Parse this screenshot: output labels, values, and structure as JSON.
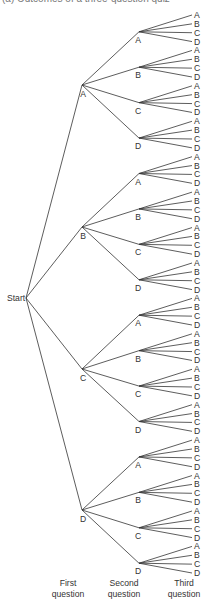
{
  "caption": "(a) Outcomes of a three-question quiz",
  "root": {
    "label": "Start",
    "x": 26,
    "y": 298,
    "label_x": 7
  },
  "options": [
    "A",
    "B",
    "C",
    "D"
  ],
  "levels": {
    "first": {
      "x": 82,
      "ys": [
        85,
        227,
        369,
        510
      ]
    },
    "second": {
      "x": 139,
      "offset": 3.5
    },
    "third": {
      "line_end_x": 192,
      "label_x": 194,
      "y_start": 15,
      "y_end": 573
    }
  },
  "style": {
    "line_color": "#333333",
    "text_color": "#333333",
    "line_width": 0.8
  },
  "axis_labels": [
    {
      "line1": "First",
      "line2": "question",
      "cx": 68
    },
    {
      "line1": "Second",
      "line2": "question",
      "cx": 124
    },
    {
      "line1": "Third",
      "line2": "question",
      "cx": 184
    }
  ]
}
